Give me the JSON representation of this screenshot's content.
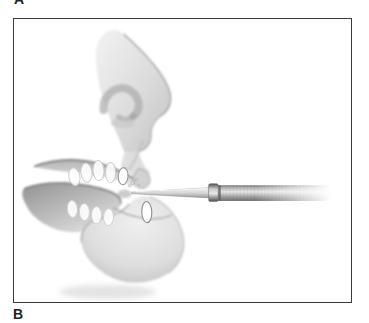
{
  "page": {
    "background_color": "#ffffff"
  },
  "figure": {
    "panel_labels": {
      "top": "A",
      "bottom": "B"
    },
    "frame_border_color": "#3a3a3a",
    "illustration": {
      "alt": "Grayscale surgical illustration: right-facing profile of a nose, retracted upper and lower lips exposing the front incisors, and chin; a fine needle-tipped cylindrical instrument enters the mouth horizontally from the right between the lips",
      "parts": [
        "nose-profile",
        "nostril-ala",
        "philtrum",
        "upper-lip",
        "upper-teeth",
        "upper-incisor",
        "lower-lip-retracted",
        "lower-teeth",
        "lower-incisor",
        "chin",
        "labiomental-crease",
        "injection-sparkle",
        "needle-tip",
        "instrument-ferrule",
        "instrument-handle",
        "under-chin-shadow"
      ]
    },
    "palette": {
      "line_dark": "#3a3a3a",
      "contour_gray": "#6e6e6e",
      "skin_light": "#efefef",
      "skin_mid": "#cccccc",
      "skin_shadow": "#9b9b9b",
      "teeth_outline": "#c9c9c9",
      "instrument_dark": "#5a5a5a",
      "instrument_mid": "#b5b5b5",
      "instrument_light": "#e9e9e9"
    }
  }
}
